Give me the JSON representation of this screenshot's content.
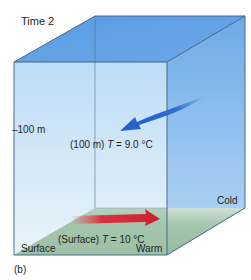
{
  "figure": {
    "title": "Time 2",
    "panel_label": "(b)",
    "depth_marker": "100 m",
    "depth_marker_prefix": "–",
    "deep_reading": {
      "prefix": "(100 m) ",
      "var": "T",
      "value": " = 9.0 °C"
    },
    "surface_reading": {
      "prefix": "(Surface) ",
      "var": "T",
      "value": " = 10 °C"
    },
    "surface_label": "Surface",
    "warm_label": "Warm",
    "cold_label": "Cold",
    "colors": {
      "top_face": "#5b9de2",
      "right_face": "#7cb3ea",
      "front_face_top": "#bcdcf6",
      "front_face_bottom": "#e6f1f8",
      "bottom_face": "#9fc3a8",
      "deep_arrow": "#2f6fd0",
      "surface_arrow": "#d6303c",
      "edge": "#3a5d82"
    }
  }
}
